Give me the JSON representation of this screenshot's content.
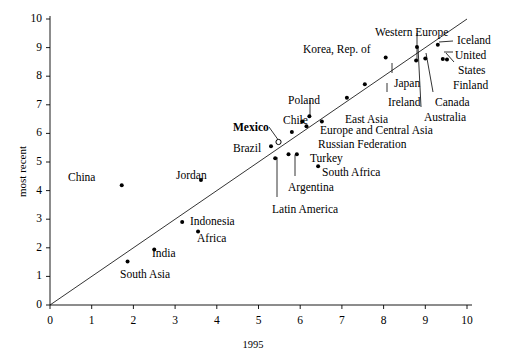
{
  "chart_data": {
    "type": "scatter",
    "title": "",
    "xlabel": "1995",
    "ylabel": "most recent",
    "xlim": [
      0,
      10
    ],
    "ylim": [
      0,
      10
    ],
    "grid": false,
    "legend": null,
    "xticks": [
      "0",
      "1",
      "2",
      "3",
      "4",
      "5",
      "6",
      "7",
      "8",
      "9",
      "10"
    ],
    "yticks": [
      "0",
      "1",
      "2",
      "3",
      "4",
      "5",
      "6",
      "7",
      "8",
      "9",
      "10"
    ],
    "reference_line": {
      "name": "45-degree-line",
      "from": [
        0,
        0
      ],
      "to": [
        10,
        10
      ],
      "note": "diagonal identity line"
    },
    "points": [
      {
        "name": "China",
        "x": 1.72,
        "y": 4.19,
        "marker": "filled"
      },
      {
        "name": "Jordan",
        "x": 3.62,
        "y": 4.37,
        "marker": "filled"
      },
      {
        "name": "Indonesia",
        "x": 3.17,
        "y": 2.9,
        "marker": "filled"
      },
      {
        "name": "Africa",
        "x": 3.55,
        "y": 2.57,
        "marker": "filled"
      },
      {
        "name": "India",
        "x": 2.5,
        "y": 1.94,
        "marker": "filled"
      },
      {
        "name": "South Asia",
        "x": 1.86,
        "y": 1.52,
        "marker": "filled"
      },
      {
        "name": "Brazil",
        "x": 5.3,
        "y": 5.55,
        "marker": "filled"
      },
      {
        "name": "Mexico",
        "x": 5.48,
        "y": 5.7,
        "marker": "open"
      },
      {
        "name": "Latin America",
        "x": 5.4,
        "y": 5.13,
        "marker": "filled"
      },
      {
        "name": "Argentina",
        "x": 5.72,
        "y": 5.27,
        "marker": "filled"
      },
      {
        "name": "Turkey",
        "x": 5.92,
        "y": 5.27,
        "marker": "filled"
      },
      {
        "name": "South Africa",
        "x": 6.43,
        "y": 4.85,
        "marker": "filled"
      },
      {
        "name": "Russian Federation",
        "x": 5.8,
        "y": 6.05,
        "marker": "filled"
      },
      {
        "name": "Europe and Central Asia",
        "x": 6.15,
        "y": 6.25,
        "marker": "filled"
      },
      {
        "name": "Chile",
        "x": 6.05,
        "y": 6.42,
        "marker": "filled"
      },
      {
        "name": "Poland",
        "x": 6.22,
        "y": 6.6,
        "marker": "filled"
      },
      {
        "name": "East Asia",
        "x": 6.52,
        "y": 6.42,
        "marker": "filled"
      },
      {
        "name": "Ireland",
        "x": 7.12,
        "y": 7.25,
        "marker": "filled"
      },
      {
        "name": "Japan",
        "x": 7.55,
        "y": 7.72,
        "marker": "filled"
      },
      {
        "name": "Korea, Rep. of",
        "x": 8.05,
        "y": 8.65,
        "marker": "filled"
      },
      {
        "name": "Western Europe",
        "x": 8.78,
        "y": 8.55,
        "marker": "filled"
      },
      {
        "name": "Australia",
        "x": 8.8,
        "y": 9.02,
        "marker": "filled"
      },
      {
        "name": "Canada",
        "x": 9.0,
        "y": 8.62,
        "marker": "filled"
      },
      {
        "name": "Iceland",
        "x": 9.3,
        "y": 9.1,
        "marker": "filled"
      },
      {
        "name": "United States",
        "x": 9.42,
        "y": 8.6,
        "marker": "filled"
      },
      {
        "name": "Finland",
        "x": 9.52,
        "y": 8.58,
        "marker": "filled"
      }
    ],
    "labels": [
      {
        "text": "China",
        "x": 68,
        "y": 172,
        "bold": false
      },
      {
        "text": "Jordan",
        "x": 176,
        "y": 170,
        "bold": false
      },
      {
        "text": "Indonesia",
        "x": 190,
        "y": 216,
        "bold": false
      },
      {
        "text": "Africa",
        "x": 197,
        "y": 233,
        "bold": false
      },
      {
        "text": "India",
        "x": 152,
        "y": 248,
        "bold": false
      },
      {
        "text": "South Asia",
        "x": 120,
        "y": 269,
        "bold": false
      },
      {
        "text": "Mexico",
        "x": 233,
        "y": 122,
        "bold": true
      },
      {
        "text": "Brazil",
        "x": 233,
        "y": 143,
        "bold": false
      },
      {
        "text": "Latin America",
        "x": 272,
        "y": 204,
        "bold": false
      },
      {
        "text": "Argentina",
        "x": 288,
        "y": 182,
        "bold": false
      },
      {
        "text": "Turkey",
        "x": 310,
        "y": 153,
        "bold": false
      },
      {
        "text": "South Africa",
        "x": 322,
        "y": 167,
        "bold": false
      },
      {
        "text": "Russian Federation",
        "x": 318,
        "y": 139,
        "bold": false
      },
      {
        "text": "Europe and Central Asia",
        "x": 320,
        "y": 125,
        "bold": false
      },
      {
        "text": "Chile",
        "x": 283,
        "y": 115,
        "bold": false
      },
      {
        "text": "Poland",
        "x": 288,
        "y": 95,
        "bold": false
      },
      {
        "text": "East Asia",
        "x": 345,
        "y": 114,
        "bold": false
      },
      {
        "text": "Ireland",
        "x": 388,
        "y": 97,
        "bold": false
      },
      {
        "text": "Japan",
        "x": 394,
        "y": 78,
        "bold": false
      },
      {
        "text": "Korea, Rep. of",
        "x": 303,
        "y": 44,
        "bold": false
      },
      {
        "text": "Western Europe",
        "x": 375,
        "y": 27,
        "bold": false
      },
      {
        "text": "Australia",
        "x": 424,
        "y": 112,
        "bold": false
      },
      {
        "text": "Canada",
        "x": 435,
        "y": 97,
        "bold": false
      },
      {
        "text": "Iceland",
        "x": 457,
        "y": 35,
        "bold": false
      },
      {
        "text": "United",
        "x": 455,
        "y": 50,
        "bold": false
      },
      {
        "text": "States",
        "x": 458,
        "y": 65,
        "bold": false
      },
      {
        "text": "Finland",
        "x": 453,
        "y": 80,
        "bold": false
      }
    ],
    "leader_lines": [
      {
        "name": "mexico-leader",
        "x1": 269,
        "y1": 127,
        "x2": 279,
        "y2": 141
      },
      {
        "name": "latin-leader",
        "x1": 277,
        "y1": 197,
        "x2": 277,
        "y2": 157
      },
      {
        "name": "argentina-leader",
        "x1": 295,
        "y1": 176,
        "x2": 295,
        "y2": 155
      },
      {
        "name": "poland-leader",
        "x1": 310,
        "y1": 100,
        "x2": 310,
        "y2": 116
      },
      {
        "name": "western-leader",
        "x1": 417,
        "y1": 33,
        "x2": 417,
        "y2": 60
      },
      {
        "name": "australia-leader",
        "x1": 421,
        "y1": 107,
        "x2": 418,
        "y2": 47
      },
      {
        "name": "canada-leader",
        "x1": 433,
        "y1": 92,
        "x2": 426,
        "y2": 53
      },
      {
        "name": "iceland-leader",
        "x1": 453,
        "y1": 41,
        "x2": 439,
        "y2": 42
      },
      {
        "name": "united-leader",
        "x1": 453,
        "y1": 52,
        "x2": 444,
        "y2": 52
      },
      {
        "name": "states-leader",
        "x1": 454,
        "y1": 62,
        "x2": 446,
        "y2": 53
      },
      {
        "name": "japan-leader",
        "x1": 392,
        "y1": 73,
        "x2": 392,
        "y2": 63
      },
      {
        "name": "ireland-leader",
        "x1": 387,
        "y1": 92,
        "x2": 387,
        "y2": 83
      }
    ]
  },
  "axis": {
    "x_title": "1995",
    "y_title": "most recent"
  }
}
